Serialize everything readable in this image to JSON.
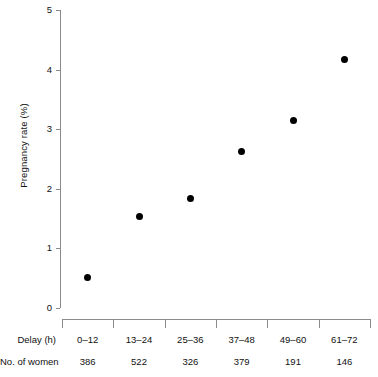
{
  "chart_data": {
    "type": "scatter",
    "title": "",
    "xlabel": "Delay (h)",
    "ylabel": "Pregnancy rate (%)",
    "categories": [
      "0–12",
      "13–24",
      "25–36",
      "37–48",
      "49–60",
      "61–72"
    ],
    "values": [
      0.51,
      1.53,
      1.83,
      2.63,
      3.15,
      4.17
    ],
    "ylim": [
      0,
      5
    ],
    "y_ticks": [
      "0",
      "1",
      "2",
      "3",
      "4",
      "5"
    ],
    "grid": false,
    "legend": null,
    "marker": {
      "shape": "circle",
      "color": "#000000",
      "size": 7
    },
    "table": {
      "rows": [
        {
          "label": "Delay (h)",
          "cells": [
            "0–12",
            "13–24",
            "25–36",
            "37–48",
            "49–60",
            "61–72"
          ]
        },
        {
          "label": "No. of women",
          "cells": [
            "386",
            "522",
            "326",
            "379",
            "191",
            "146"
          ]
        }
      ]
    }
  },
  "axes": {
    "y_title": "Pregnancy rate (%)",
    "y_tick_labels": [
      "5",
      "4",
      "3",
      "2",
      "1",
      "0"
    ]
  },
  "table_labels": {
    "delay_row": "Delay (h)",
    "women_row": "No. of women"
  },
  "colors": {
    "marker": "#000000",
    "axis": "#8a8a8a",
    "text": "#111111",
    "background": "#ffffff"
  }
}
